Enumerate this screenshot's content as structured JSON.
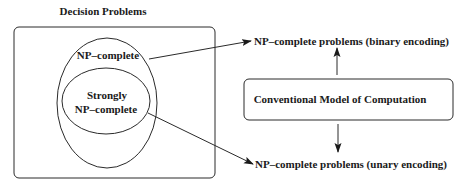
{
  "diagram": {
    "title": "Decision Problems",
    "outer_set": {
      "label": "NP–complete"
    },
    "inner_set": {
      "label_line1": "Strongly",
      "label_line2": "NP–complete"
    },
    "model_box": {
      "label": "Conventional Model of Computation"
    },
    "targets": {
      "binary": "NP–complete problems (binary encoding)",
      "unary": "NP–complete problems (unary encoding)"
    },
    "edges": [
      {
        "from": "NP–complete",
        "to": "NP–complete problems (binary encoding)"
      },
      {
        "from": "Strongly NP–complete",
        "to": "NP–complete problems (unary encoding)"
      },
      {
        "from": "Conventional Model of Computation",
        "to": "NP–complete problems (binary encoding)"
      },
      {
        "from": "Conventional Model of Computation",
        "to": "NP–complete problems (unary encoding)"
      }
    ],
    "colors": {
      "stroke": "#2a2a2a",
      "text": "#1a1a1a",
      "background": "#ffffff"
    }
  }
}
